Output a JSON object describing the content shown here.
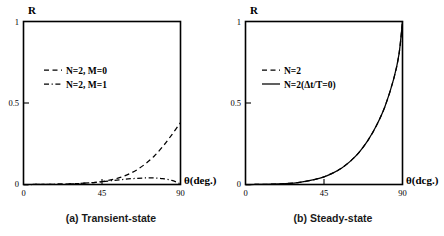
{
  "figure": {
    "panels": [
      {
        "id": "transient",
        "caption": "(a) Transient-state",
        "y_axis_title": "R",
        "x_axis_title": "θ(deg.)",
        "y_ticks": [
          "0",
          "0.5",
          "1"
        ],
        "x_ticks": [
          "0",
          "45",
          "90"
        ],
        "legend": [
          {
            "label": "N=2,  M=0",
            "style": "dashed"
          },
          {
            "label": "N=2,  M=1",
            "style": "dashdot"
          }
        ]
      },
      {
        "id": "steady",
        "caption": "(b) Steady-state",
        "y_axis_title": "R",
        "x_axis_title": "θ(dcg.)",
        "y_ticks": [
          "0",
          "0.5",
          "1"
        ],
        "x_ticks": [
          "0",
          "45",
          "90"
        ],
        "legend": [
          {
            "label": "N=2",
            "style": "dashed"
          },
          {
            "label": "N=2(Δt/T=0)",
            "style": "solid"
          }
        ]
      }
    ]
  },
  "chart_data": [
    {
      "type": "line",
      "title": "(a) Transient-state",
      "xlabel": "θ(deg.)",
      "ylabel": "R",
      "xlim": [
        0,
        90
      ],
      "ylim": [
        0,
        1
      ],
      "xticks": [
        0,
        45,
        90
      ],
      "yticks": [
        0,
        0.5,
        1
      ],
      "grid": false,
      "legend_position": "upper-left-inside",
      "series": [
        {
          "name": "N=2,  M=0",
          "style": "dashed",
          "x": [
            0,
            5,
            10,
            15,
            20,
            25,
            30,
            35,
            40,
            45,
            50,
            55,
            60,
            65,
            70,
            75,
            80,
            85,
            90
          ],
          "y": [
            0,
            0,
            0.001,
            0.001,
            0.002,
            0.003,
            0.005,
            0.008,
            0.012,
            0.018,
            0.028,
            0.042,
            0.062,
            0.09,
            0.128,
            0.175,
            0.235,
            0.305,
            0.38
          ]
        },
        {
          "name": "N=2,  M=1",
          "style": "dashdot",
          "x": [
            0,
            5,
            10,
            15,
            20,
            25,
            30,
            35,
            40,
            45,
            50,
            55,
            60,
            65,
            70,
            75,
            80,
            85,
            90
          ],
          "y": [
            0,
            0,
            0.001,
            0.001,
            0.002,
            0.003,
            0.005,
            0.008,
            0.012,
            0.017,
            0.023,
            0.029,
            0.034,
            0.038,
            0.04,
            0.04,
            0.036,
            0.025,
            0.004
          ]
        }
      ]
    },
    {
      "type": "line",
      "title": "(b) Steady-state",
      "xlabel": "θ(dcg.)",
      "ylabel": "R",
      "xlim": [
        0,
        90
      ],
      "ylim": [
        0,
        1
      ],
      "xticks": [
        0,
        45,
        90
      ],
      "yticks": [
        0,
        0.5,
        1
      ],
      "grid": false,
      "legend_position": "upper-left-inside",
      "series": [
        {
          "name": "N=2",
          "style": "dashed",
          "x": [
            0,
            5,
            10,
            15,
            20,
            25,
            30,
            35,
            40,
            45,
            50,
            55,
            60,
            65,
            70,
            75,
            80,
            85,
            88,
            90
          ],
          "y": [
            0,
            0,
            0.001,
            0.002,
            0.004,
            0.007,
            0.012,
            0.02,
            0.031,
            0.047,
            0.07,
            0.1,
            0.142,
            0.196,
            0.268,
            0.36,
            0.48,
            0.65,
            0.8,
            1.0
          ]
        },
        {
          "name": "N=2(Δt/T=0)",
          "style": "solid",
          "x": [
            0,
            5,
            10,
            15,
            20,
            25,
            30,
            35,
            40,
            45,
            50,
            55,
            60,
            65,
            70,
            75,
            80,
            85,
            88,
            90
          ],
          "y": [
            0,
            0,
            0.001,
            0.002,
            0.004,
            0.007,
            0.012,
            0.02,
            0.031,
            0.047,
            0.07,
            0.1,
            0.142,
            0.196,
            0.268,
            0.36,
            0.48,
            0.65,
            0.8,
            1.0
          ]
        }
      ]
    }
  ]
}
